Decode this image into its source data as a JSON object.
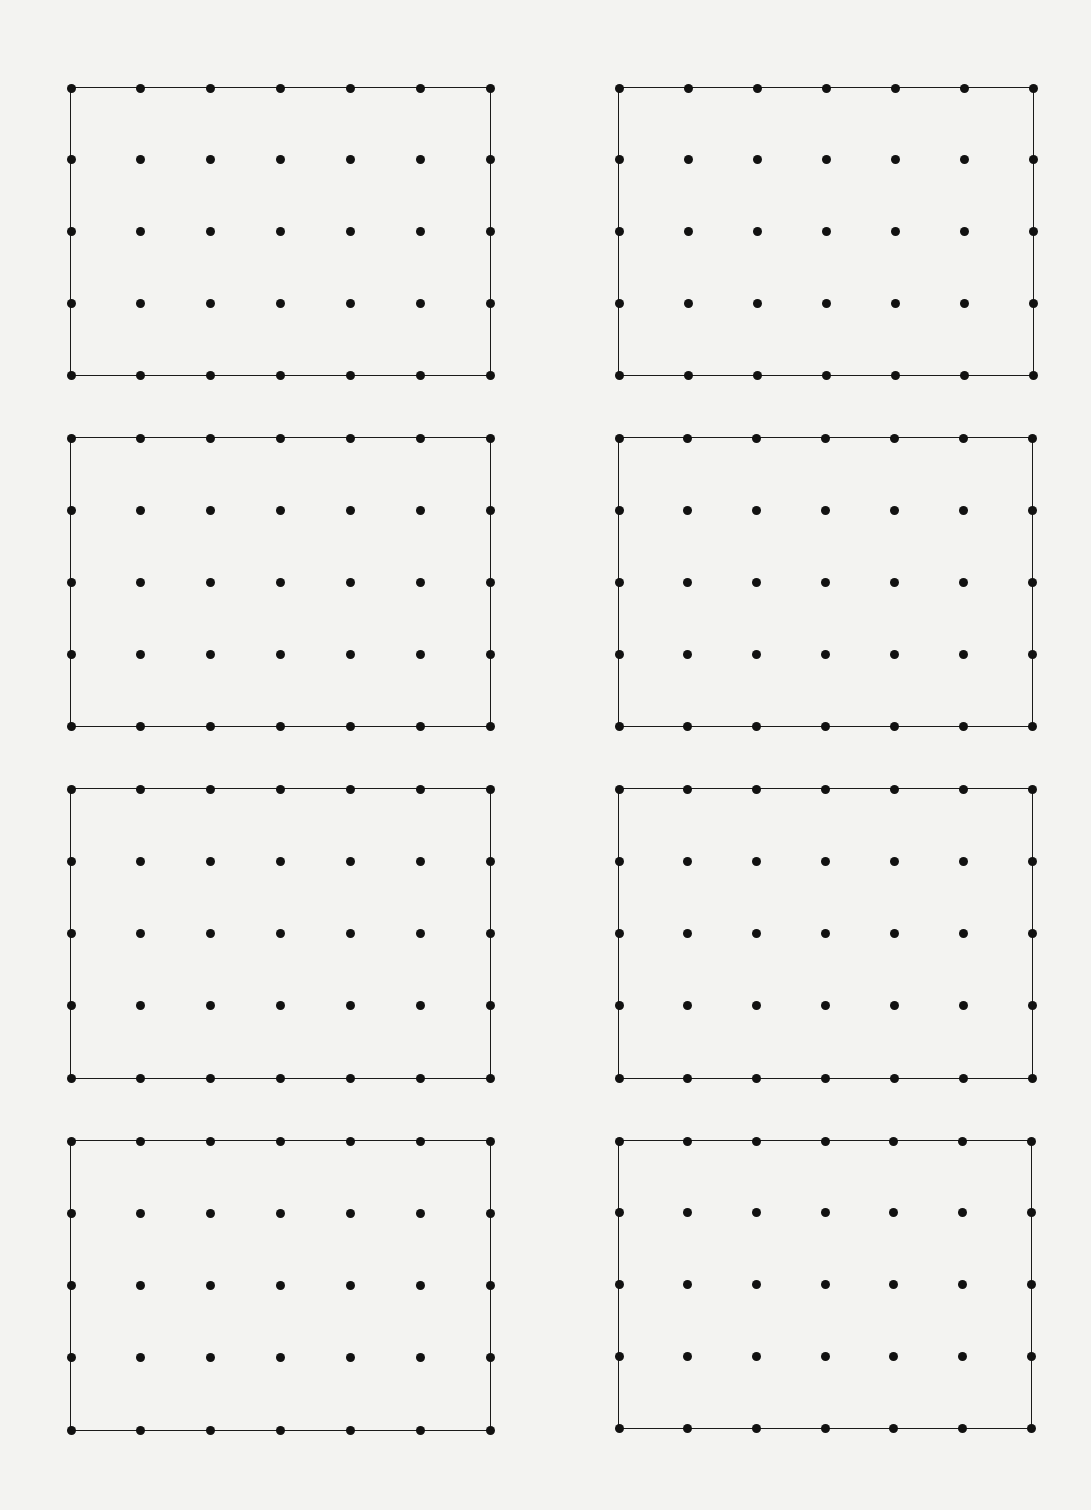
{
  "page": {
    "background": "#f3f3f1",
    "ink": "#111111"
  },
  "grid_spec": {
    "columns": 7,
    "rows": 5
  },
  "geoboards": [
    {
      "id": "row1-left",
      "x0": 71,
      "y0": 88,
      "x1": 490,
      "y1": 375
    },
    {
      "id": "row1-right",
      "x0": 619,
      "y0": 88,
      "x1": 1033,
      "y1": 375
    },
    {
      "id": "row2-left",
      "x0": 71,
      "y0": 438,
      "x1": 490,
      "y1": 726
    },
    {
      "id": "row2-right",
      "x0": 619,
      "y0": 438,
      "x1": 1032,
      "y1": 726
    },
    {
      "id": "row3-left",
      "x0": 71,
      "y0": 789,
      "x1": 490,
      "y1": 1078
    },
    {
      "id": "row3-right",
      "x0": 619,
      "y0": 789,
      "x1": 1032,
      "y1": 1078
    },
    {
      "id": "row4-left",
      "x0": 71,
      "y0": 1141,
      "x1": 490,
      "y1": 1430
    },
    {
      "id": "row4-right",
      "x0": 619,
      "y0": 1141,
      "x1": 1031,
      "y1": 1428
    }
  ]
}
